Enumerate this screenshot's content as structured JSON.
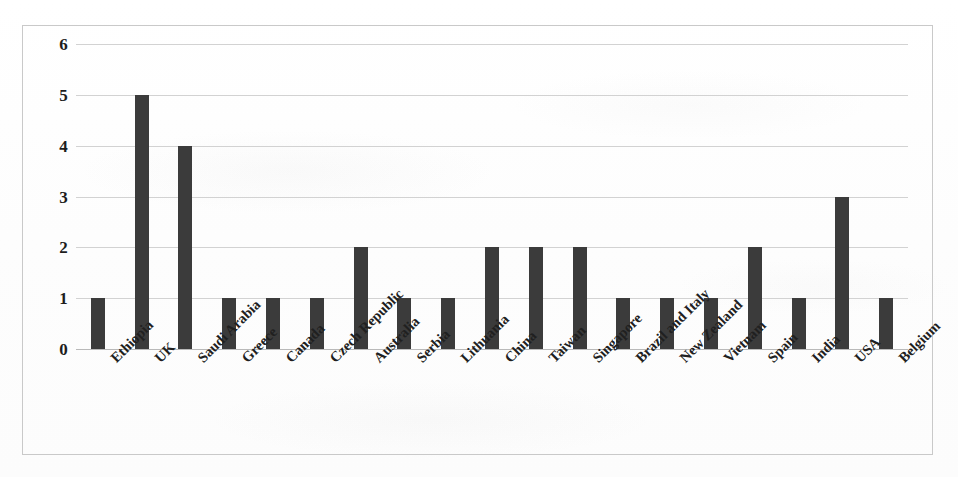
{
  "figure": {
    "background_color": "#fefefe",
    "frame_color": "#c9c9c9",
    "bar_color": "#3b3b3b",
    "gridline_color": "#d2d2d2",
    "text_color": "#1d1d1d"
  },
  "chart_data": {
    "type": "bar",
    "title": "",
    "subtitle": "",
    "xlabel": "",
    "ylabel": "",
    "ylim": [
      0,
      6
    ],
    "yticks": [
      0,
      1,
      2,
      3,
      4,
      5,
      6
    ],
    "ytick_labels": [
      "0",
      "1",
      "2",
      "3",
      "4",
      "5",
      "6"
    ],
    "grid": true,
    "legend": false,
    "legend_position": "none",
    "xtick_rotation": -45,
    "categories": [
      "Ethiopia",
      "UK",
      "Saudi Arabia",
      "Greece",
      "Canada",
      "Czech Republic",
      "Australia",
      "Serbia",
      "Lithuania",
      "China",
      "Taiwan",
      "Singapore",
      "Brazil and Italy",
      "New Zealand",
      "Vietnam",
      "Spain",
      "India",
      "USA",
      "Belgium"
    ],
    "values": [
      1,
      5,
      4,
      1,
      1,
      1,
      2,
      1,
      1,
      2,
      2,
      2,
      1,
      1,
      1,
      2,
      1,
      3,
      1
    ]
  }
}
